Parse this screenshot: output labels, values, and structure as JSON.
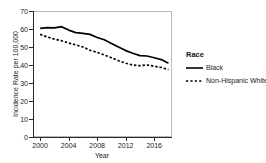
{
  "chart_data": {
    "type": "line",
    "title": "",
    "xlabel": "Year",
    "ylabel": "Incidence Rate per 100,000",
    "xlim": [
      1999,
      2018.5
    ],
    "ylim": [
      0,
      70
    ],
    "xticks": [
      "2000",
      "2004",
      "2008",
      "2012",
      "2016"
    ],
    "xtick_values": [
      2000,
      2004,
      2008,
      2012,
      2016
    ],
    "yticks": [
      "0",
      "10",
      "20",
      "30",
      "40",
      "50",
      "60",
      "70"
    ],
    "ytick_values": [
      0,
      10,
      20,
      30,
      40,
      50,
      60,
      70
    ],
    "grid": false,
    "legend_position": "right",
    "legend_title": "Race",
    "x": [
      2000,
      2001,
      2002,
      2003,
      2004,
      2005,
      2006,
      2007,
      2008,
      2009,
      2010,
      2011,
      2012,
      2013,
      2014,
      2015,
      2016,
      2017,
      2018
    ],
    "series": [
      {
        "name": "Black",
        "style": "solid",
        "color": "#000000",
        "values": [
          60.4,
          60.8,
          60.6,
          61.3,
          59.4,
          58.0,
          57.6,
          57.0,
          55.3,
          54.0,
          52.0,
          50.0,
          48.0,
          46.5,
          45.2,
          45.0,
          44.0,
          43.0,
          41.0
        ]
      },
      {
        "name": "Non-Hispanic White",
        "style": "dashed",
        "color": "#000000",
        "values": [
          57.0,
          55.6,
          54.4,
          53.5,
          52.2,
          51.2,
          50.0,
          48.2,
          47.0,
          45.6,
          44.0,
          42.4,
          41.0,
          40.0,
          39.6,
          40.0,
          39.3,
          38.6,
          37.4
        ]
      }
    ]
  },
  "legend": {
    "title": "Race",
    "entries": [
      {
        "label": "Black",
        "key": "solid-line-key"
      },
      {
        "label": "Non-Hispanic White",
        "key": "dashed-line-key"
      }
    ]
  },
  "axes": {
    "x_title": "Year",
    "y_title": "Incidence Rate per 100,000"
  }
}
